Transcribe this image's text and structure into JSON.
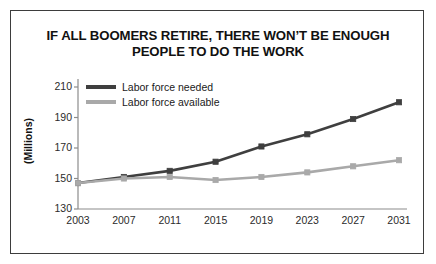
{
  "chart_data": {
    "type": "line",
    "title": "IF ALL BOOMERS RETIRE, THERE WON’T BE ENOUGH PEOPLE TO DO THE WORK",
    "title_line1": "IF ALL BOOMERS RETIRE, THERE WON’T BE ENOUGH",
    "title_line2": "PEOPLE TO DO THE WORK",
    "xlabel": "",
    "ylabel": "(Millions)",
    "x": [
      2003,
      2007,
      2011,
      2015,
      2019,
      2023,
      2027,
      2031
    ],
    "categories": [
      "2003",
      "2007",
      "2011",
      "2015",
      "2019",
      "2023",
      "2027",
      "2031"
    ],
    "yticks": [
      130,
      150,
      170,
      190,
      210
    ],
    "ylim": [
      130,
      210
    ],
    "xlim": [
      2003,
      2031
    ],
    "grid": false,
    "legend_position": "top-left",
    "series": [
      {
        "name": "Labor force needed",
        "color": "#3f3f3f",
        "values": [
          147,
          151,
          155,
          161,
          171,
          179,
          189,
          200
        ]
      },
      {
        "name": "Labor force available",
        "color": "#a9a9a9",
        "values": [
          147,
          150,
          151,
          149,
          151,
          154,
          158,
          162
        ]
      }
    ]
  },
  "colors": {
    "border": "#3d3d3d",
    "axis": "#8c8c8c",
    "text": "#111111",
    "series_needed": "#3f3f3f",
    "series_available": "#a9a9a9"
  }
}
